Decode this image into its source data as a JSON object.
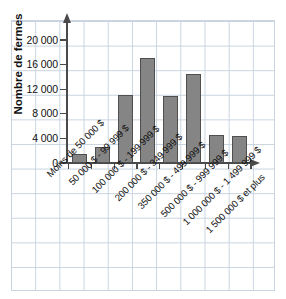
{
  "chart_data": {
    "type": "bar",
    "title": "",
    "xlabel": "",
    "ylabel": "Nombre de fermes",
    "ylim": [
      0,
      21000
    ],
    "yticks": [
      0,
      4000,
      8000,
      12000,
      16000,
      20000
    ],
    "ytick_labels": [
      "0",
      "4 000",
      "8 000",
      "12 000",
      "16 000",
      "20 000"
    ],
    "grid": true,
    "legend": "none",
    "categories": [
      "Moins de 50 000 $",
      "50 000 $ - 99 999 $",
      "100 000 $ - 199 999 $",
      "200 000 $ - 349 999 $",
      "350 000 $ - 499 999 $",
      "500 000 $ - 999 999 $",
      "1 000 000 $ - 1 499 999 $",
      "1 500 000 $ et plus"
    ],
    "values": [
      1400,
      2600,
      11000,
      17000,
      10900,
      14500,
      4600,
      4400
    ],
    "bar_color": "#858585",
    "bar_edge_color": "#4f4f4f",
    "grid_color": "#c9d4e0",
    "axis_color": "#4a4a4a"
  }
}
